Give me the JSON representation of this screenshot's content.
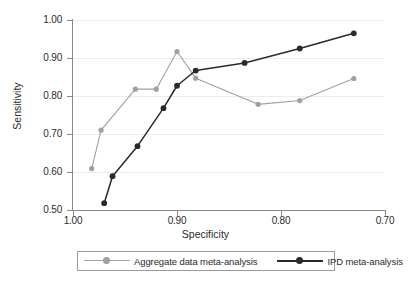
{
  "figure": {
    "background": "#ffffff"
  },
  "axes": {
    "x": {
      "title": "Specificity",
      "ticks": [
        "1.00",
        "0.90",
        "0.80",
        "0.70"
      ],
      "values": [
        1.0,
        0.9,
        0.8,
        0.7
      ],
      "min": 1.0,
      "max": 0.7,
      "reversed": true
    },
    "y": {
      "title": "Sensitivity",
      "ticks": [
        "0.50",
        "0.60",
        "0.70",
        "0.80",
        "0.90",
        "1.00"
      ],
      "values": [
        0.5,
        0.6,
        0.7,
        0.8,
        0.9,
        1.0
      ],
      "min": 0.5,
      "max": 1.0,
      "reversed": false
    }
  },
  "legend": {
    "position": "bottom",
    "entries": [
      {
        "label": "Aggregate data meta-analysis",
        "color": "#a0a0a0"
      },
      {
        "label": "IPD meta-analysis",
        "color": "#2a2a2a"
      }
    ]
  },
  "colors": {
    "aggregate": "#a0a0a0",
    "ipd": "#2a2a2a",
    "axis": "#8a8a8a",
    "grid": "#ececec",
    "text": "#2b2b2b"
  },
  "chart_data": {
    "type": "line",
    "title": "",
    "subtitle": "",
    "xlabel": "Specificity",
    "ylabel": "Sensitivity",
    "xlim": [
      1.0,
      0.7
    ],
    "ylim": [
      0.5,
      1.0
    ],
    "x_reversed": true,
    "grid": true,
    "legend_position": "bottom",
    "xticks": [
      1.0,
      0.9,
      0.8,
      0.7
    ],
    "yticks": [
      0.5,
      0.6,
      0.7,
      0.8,
      0.9,
      1.0
    ],
    "series": [
      {
        "name": "Aggregate data meta-analysis",
        "color": "#a0a0a0",
        "marker": "circle",
        "points": [
          {
            "x": 0.982,
            "y": 0.609
          },
          {
            "x": 0.973,
            "y": 0.71
          },
          {
            "x": 0.94,
            "y": 0.818
          },
          {
            "x": 0.92,
            "y": 0.818
          },
          {
            "x": 0.9,
            "y": 0.917
          },
          {
            "x": 0.882,
            "y": 0.847
          },
          {
            "x": 0.822,
            "y": 0.778
          },
          {
            "x": 0.782,
            "y": 0.788
          },
          {
            "x": 0.73,
            "y": 0.846
          }
        ]
      },
      {
        "name": "IPD meta-analysis",
        "color": "#2a2a2a",
        "marker": "circle",
        "points": [
          {
            "x": 0.97,
            "y": 0.518
          },
          {
            "x": 0.962,
            "y": 0.589
          },
          {
            "x": 0.938,
            "y": 0.668
          },
          {
            "x": 0.913,
            "y": 0.768
          },
          {
            "x": 0.9,
            "y": 0.827
          },
          {
            "x": 0.882,
            "y": 0.867
          },
          {
            "x": 0.835,
            "y": 0.887
          },
          {
            "x": 0.782,
            "y": 0.925
          },
          {
            "x": 0.73,
            "y": 0.965
          }
        ]
      }
    ]
  }
}
